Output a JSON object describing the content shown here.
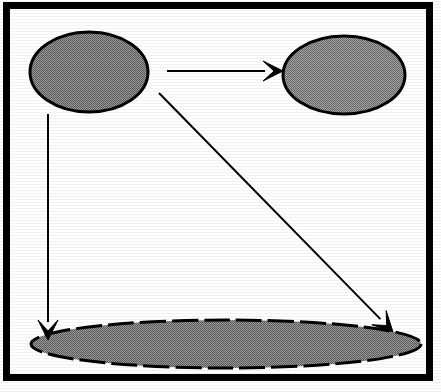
{
  "figure": {
    "canvas": {
      "width": 441,
      "height": 392,
      "background": "#ffffff"
    },
    "frame": {
      "name": "outer-border",
      "x": 3,
      "y": 2,
      "width": 430,
      "height": 379,
      "stroke": "#000000",
      "stroke_width": 7,
      "fill": "#ffffff",
      "outer_margin_color": "#ffffff"
    },
    "palette": {
      "ellipse_fill": "#7d7d7d",
      "ellipse_fill_light": "#8a8a8a",
      "ellipse_stroke": "#000000",
      "arrow_color": "#000000",
      "background": "#ffffff"
    },
    "nodes": [
      {
        "id": "node-top-left",
        "shape": "ellipse",
        "label": "",
        "cx": 89,
        "cy": 72,
        "rx": 59,
        "ry": 40,
        "fill": "#767676",
        "stroke": "#000000",
        "stroke_width": 3,
        "dash": "0"
      },
      {
        "id": "node-top-right",
        "shape": "ellipse",
        "label": "",
        "cx": 344,
        "cy": 75,
        "rx": 61,
        "ry": 39,
        "fill": "#838383",
        "stroke": "#000000",
        "stroke_width": 3,
        "dash": "0"
      },
      {
        "id": "node-bottom",
        "shape": "ellipse",
        "label": "",
        "cx": 226,
        "cy": 344,
        "rx": 195,
        "ry": 24,
        "fill": "#808080",
        "stroke": "#000000",
        "stroke_width": 3,
        "dash": "26 6"
      }
    ],
    "edges": [
      {
        "id": "edge-left-to-right",
        "from": "node-top-left",
        "to": "node-top-right",
        "label": "",
        "x1": 167,
        "y1": 71,
        "x2": 283,
        "y2": 71,
        "stroke": "#000000",
        "stroke_width": 2,
        "arrowhead": "barbed-filled"
      },
      {
        "id": "edge-left-to-bottom",
        "from": "node-top-left",
        "to": "node-bottom",
        "label": "",
        "x1": 48,
        "y1": 114,
        "x2": 48,
        "y2": 340,
        "stroke": "#000000",
        "stroke_width": 2,
        "arrowhead": "barbed-filled"
      },
      {
        "id": "edge-diagonal-to-bottom",
        "from": "node-top-left",
        "to": "node-bottom",
        "label": "",
        "x1": 159,
        "y1": 93,
        "x2": 393,
        "y2": 332,
        "stroke": "#000000",
        "stroke_width": 2,
        "arrowhead": "barbed-filled"
      }
    ]
  }
}
